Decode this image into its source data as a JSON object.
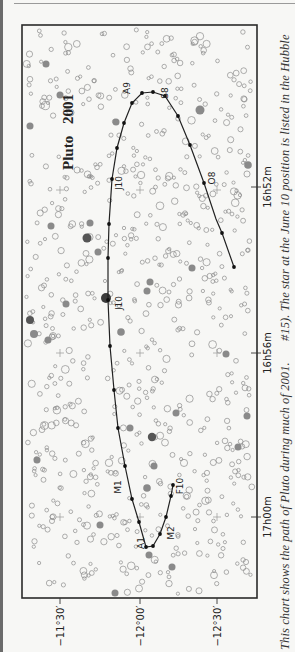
{
  "chart_data": {
    "type": "scatter",
    "title": "Pluto 2001",
    "axes": {
      "ra": {
        "label": "Right Ascension",
        "ticks": [
          "16h52m",
          "16h56m",
          "17h00m"
        ]
      },
      "dec": {
        "label": "Declination",
        "ticks": [
          "−11°30′",
          "−12°00′",
          "−12°30′"
        ]
      }
    },
    "path_labels": [
      "F10",
      "M2",
      "A1",
      "M1",
      "J10",
      "J10",
      "A9",
      "S8",
      "O8"
    ],
    "path_label_meaning": "Month + day markers (F=Feb, M=Mar, A=Apr, M=May, J=Jun, J=Jul, A=Aug, S=Sep, O=Oct)",
    "grid": false,
    "legend": null
  },
  "figure": {
    "title_word1": "Pluto",
    "title_word2": "2001",
    "frame": {
      "x": 22,
      "y": 25,
      "w": 235,
      "h": 573
    },
    "ra_ticks": [
      {
        "label": "16h52m",
        "y": 187
      },
      {
        "label": "16h56m",
        "y": 353
      },
      {
        "label": "17h00m",
        "y": 517
      }
    ],
    "dec_ticks": [
      {
        "label": "−11°30′",
        "x": 60
      },
      {
        "label": "−12°00′",
        "x": 140
      },
      {
        "label": "−12°30′",
        "x": 217
      }
    ],
    "path_points": [
      [
        234,
        267
      ],
      [
        222,
        233
      ],
      [
        216,
        219
      ],
      [
        204,
        183
      ],
      [
        190,
        145
      ],
      [
        178,
        116
      ],
      [
        165,
        96
      ],
      [
        153,
        92
      ],
      [
        142,
        93
      ],
      [
        132,
        103
      ],
      [
        124,
        123
      ],
      [
        117,
        148
      ],
      [
        112,
        179
      ],
      [
        109,
        224
      ],
      [
        108,
        258
      ],
      [
        108,
        300
      ],
      [
        110,
        346
      ],
      [
        112,
        368
      ],
      [
        114,
        390
      ],
      [
        118,
        428
      ],
      [
        125,
        466
      ],
      [
        132,
        499
      ],
      [
        139,
        522
      ],
      [
        146,
        547
      ],
      [
        153,
        546
      ],
      [
        160,
        534
      ],
      [
        166,
        517
      ],
      [
        171,
        496
      ],
      [
        173,
        485
      ]
    ],
    "path_dots": [
      [
        234,
        267
      ],
      [
        222,
        233
      ],
      [
        204,
        183
      ],
      [
        190,
        145
      ],
      [
        178,
        116
      ],
      [
        165,
        96
      ],
      [
        153,
        92
      ],
      [
        142,
        93
      ],
      [
        132,
        103
      ],
      [
        124,
        123
      ],
      [
        117,
        148
      ],
      [
        112,
        179
      ],
      [
        109,
        224
      ],
      [
        108,
        258
      ],
      [
        108,
        300
      ],
      [
        110,
        346
      ],
      [
        114,
        390
      ],
      [
        118,
        428
      ],
      [
        125,
        466
      ],
      [
        132,
        499
      ],
      [
        139,
        522
      ],
      [
        146,
        547
      ],
      [
        153,
        546
      ],
      [
        160,
        534
      ],
      [
        166,
        517
      ],
      [
        171,
        496
      ],
      [
        173,
        485
      ]
    ],
    "labels": [
      {
        "text": "A9",
        "x": 130,
        "y": 88
      },
      {
        "text": "S8",
        "x": 168,
        "y": 93
      },
      {
        "text": "O8",
        "x": 215,
        "y": 178
      },
      {
        "text": "J10",
        "x": 122,
        "y": 183
      },
      {
        "text": "J10",
        "x": 122,
        "y": 303
      },
      {
        "text": "M1",
        "x": 121,
        "y": 487
      },
      {
        "text": "A1",
        "x": 144,
        "y": 543
      },
      {
        "text": "M2",
        "x": 174,
        "y": 533
      },
      {
        "text": "F10",
        "x": 183,
        "y": 486
      }
    ],
    "crosses": [
      [
        60,
        190
      ],
      [
        140,
        190
      ],
      [
        217,
        190
      ],
      [
        60,
        353
      ],
      [
        140,
        353
      ],
      [
        217,
        353
      ],
      [
        60,
        517
      ],
      [
        140,
        517
      ],
      [
        217,
        517
      ]
    ],
    "filled_stars": [
      [
        46,
        64,
        3.5,
        "#8a8a8a"
      ],
      [
        30,
        126,
        3.5,
        "#8a8a8a"
      ],
      [
        116,
        122,
        3.5,
        "#8a8a8a"
      ],
      [
        200,
        110,
        4.5,
        "#8a8a8a"
      ],
      [
        248,
        165,
        3.8,
        "#8a8a8a"
      ],
      [
        51,
        226,
        3.5,
        "#8a8a8a"
      ],
      [
        90,
        223,
        3.5,
        "#8a8a8a"
      ],
      [
        87,
        238,
        4.5,
        "#555"
      ],
      [
        98,
        252,
        3.5,
        "#8a8a8a"
      ],
      [
        192,
        268,
        3.5,
        "#8a8a8a"
      ],
      [
        150,
        282,
        3.5,
        "#8a8a8a"
      ],
      [
        147,
        291,
        3.5,
        "#8a8a8a"
      ],
      [
        106,
        298,
        5,
        "#3c3c3c"
      ],
      [
        66,
        304,
        3.5,
        "#8a8a8a"
      ],
      [
        30,
        320,
        4,
        "#555"
      ],
      [
        34,
        334,
        4,
        "#8a8a8a"
      ],
      [
        48,
        340,
        3.5,
        "#8a8a8a"
      ],
      [
        121,
        332,
        3.8,
        "#8a8a8a"
      ],
      [
        226,
        354,
        3.5,
        "#8a8a8a"
      ],
      [
        176,
        413,
        3.5,
        "#8a8a8a"
      ],
      [
        247,
        416,
        3.5,
        "#8a8a8a"
      ],
      [
        130,
        428,
        3.5,
        "#8a8a8a"
      ],
      [
        152,
        437,
        4.2,
        "#555"
      ],
      [
        154,
        466,
        3.5,
        "#8a8a8a"
      ],
      [
        147,
        488,
        3.8,
        "#8a8a8a"
      ],
      [
        100,
        525,
        3.5,
        "#8a8a8a"
      ],
      [
        238,
        447,
        3.5,
        "#8a8a8a"
      ],
      [
        149,
        555,
        3.5,
        "#8a8a8a"
      ],
      [
        172,
        567,
        3.5,
        "#8a8a8a"
      ],
      [
        115,
        593,
        3.5,
        "#8a8a8a"
      ],
      [
        37,
        460,
        3.5,
        "#8a8a8a"
      ],
      [
        60,
        95,
        3.5,
        "#8a8a8a"
      ]
    ],
    "colors": {
      "frame": "#2a2a2a",
      "path": "#222222",
      "star_outline": "#8c8c8c",
      "text": "#222222"
    }
  },
  "caption": {
    "part1": "This chart shows the path of Pluto during much of 2001.",
    "part2": "#15). The star at the June 10 position is listed in the Hubble"
  }
}
